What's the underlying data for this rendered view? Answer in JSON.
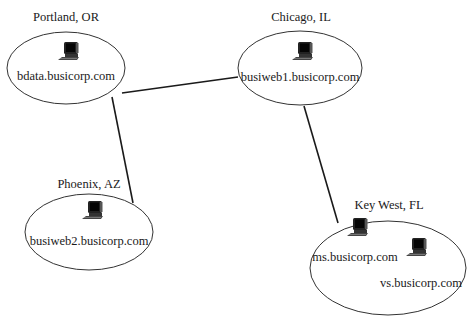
{
  "diagram": {
    "type": "network-topology",
    "sites": [
      {
        "id": "portland",
        "location": "Portland, OR",
        "hosts": [
          {
            "name": "bdata.busicorp.com",
            "icon": "desktop-computer-icon"
          }
        ]
      },
      {
        "id": "chicago",
        "location": "Chicago, IL",
        "hosts": [
          {
            "name": "busiweb1.busicorp.com",
            "icon": "desktop-computer-icon"
          }
        ]
      },
      {
        "id": "phoenix",
        "location": "Phoenix, AZ",
        "hosts": [
          {
            "name": "busiweb2.busicorp.com",
            "icon": "desktop-computer-icon"
          }
        ]
      },
      {
        "id": "keywest",
        "location": "Key West, FL",
        "hosts": [
          {
            "name": "ms.busicorp.com",
            "icon": "desktop-computer-icon"
          },
          {
            "name": "vs.busicorp.com",
            "icon": "desktop-computer-icon"
          }
        ]
      }
    ],
    "links": [
      {
        "from": "portland",
        "to": "chicago"
      },
      {
        "from": "portland",
        "to": "phoenix"
      },
      {
        "from": "chicago",
        "to": "keywest"
      }
    ],
    "colors": {
      "line": "#1a1a1a",
      "ellipse_stroke": "#333333",
      "background": "#ffffff"
    }
  }
}
